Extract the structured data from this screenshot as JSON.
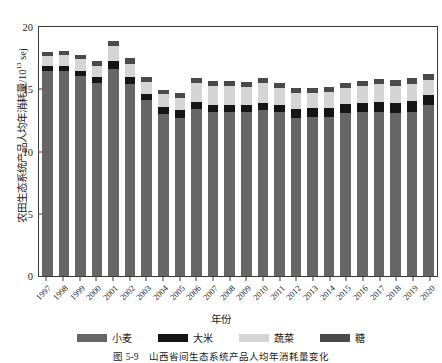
{
  "figure": {
    "caption_number": "图 5-9",
    "caption_text": "山西省间生态系统产品人均年消耗量变化"
  },
  "axes": {
    "ylabel_text": "农田生态系统产品人均年消耗量/10",
    "ylabel_exponent": "13",
    "ylabel_unit": " sej",
    "xlabel": "年份",
    "yticks": [
      "0",
      "5",
      "10",
      "15",
      "20"
    ]
  },
  "legend": [
    {
      "label": "小麦",
      "color": "#666666"
    },
    {
      "label": "大米",
      "color": "#151515"
    },
    {
      "label": "蔬菜",
      "color": "#d5d5d5"
    },
    {
      "label": "糖",
      "color": "#4a4a4a"
    }
  ],
  "chart_data": {
    "type": "bar",
    "stacked": true,
    "title": "",
    "xlabel": "年份",
    "ylabel": "农田生态系统产品人均年消耗量/10^13 sej",
    "ylim": [
      0,
      20
    ],
    "ytick_interval": 5,
    "grid": false,
    "legend_position": "bottom",
    "categories": [
      "1997",
      "1998",
      "1999",
      "2000",
      "2001",
      "2002",
      "2003",
      "2004",
      "2005",
      "2006",
      "2007",
      "2008",
      "2009",
      "2010",
      "2011",
      "2012",
      "2013",
      "2014",
      "2015",
      "2016",
      "2017",
      "2018",
      "2019",
      "2020"
    ],
    "series": [
      {
        "name": "小麦",
        "color": "#666666",
        "values": [
          16.3,
          16.3,
          15.9,
          15.4,
          16.5,
          15.3,
          14.0,
          12.9,
          12.6,
          13.3,
          13.1,
          13.1,
          13.1,
          13.2,
          13.1,
          12.6,
          12.7,
          12.7,
          13.0,
          13.1,
          13.1,
          13.0,
          13.1,
          13.6
        ]
      },
      {
        "name": "大米",
        "color": "#151515",
        "values": [
          0.45,
          0.45,
          0.42,
          0.42,
          0.6,
          0.52,
          0.48,
          0.6,
          0.62,
          0.55,
          0.55,
          0.55,
          0.52,
          0.6,
          0.55,
          0.7,
          0.68,
          0.68,
          0.72,
          0.72,
          0.78,
          0.8,
          0.82,
          0.82
        ]
      },
      {
        "name": "蔬菜",
        "color": "#d5d5d5",
        "values": [
          0.75,
          0.85,
          0.95,
          0.95,
          1.2,
          1.1,
          0.95,
          1.0,
          1.0,
          1.55,
          1.5,
          1.5,
          1.45,
          1.6,
          1.3,
          1.25,
          1.2,
          1.3,
          1.25,
          1.3,
          1.4,
          1.35,
          1.4,
          1.2
        ]
      },
      {
        "name": "糖",
        "color": "#4a4a4a",
        "values": [
          0.35,
          0.35,
          0.35,
          0.35,
          0.45,
          0.45,
          0.4,
          0.35,
          0.35,
          0.4,
          0.4,
          0.4,
          0.4,
          0.4,
          0.4,
          0.4,
          0.4,
          0.4,
          0.4,
          0.45,
          0.45,
          0.5,
          0.5,
          0.5
        ]
      }
    ]
  }
}
